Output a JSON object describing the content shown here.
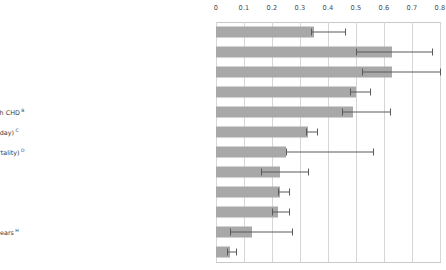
{
  "chart_data": {
    "type": "bar",
    "orientation": "horizontal",
    "title": "",
    "subtitle": "",
    "xlabel": "",
    "ylabel": "",
    "xlim": [
      0,
      0.8
    ],
    "grid": true,
    "legend": "none",
    "tick_labels": [
      "0",
      "0.1",
      "0.2",
      "0.3",
      "0.4",
      "0.5",
      "0.6",
      "0.7",
      "0.8"
    ],
    "tick_values": [
      0,
      0.1,
      0.2,
      0.3,
      0.4,
      0.5,
      0.6,
      0.7,
      0.8
    ],
    "categories": [
      "Social Relationships: Overall findings from this meta-analysis",
      "Social Relationships: High vs. low social support contrasted",
      "Social Relationships: Complex measures of social integration",
      "Smoking < 15 cigarettes daily",
      "Smoking Cessation: Cease vs. Continue smoking among patients with CHD",
      "Alcohol Consumption: Abstinence vs. Excessive drinking (> 6 drinks/day)",
      "Flu Vaccine: Pneumococcal vaccination in adults (for pneumonia mortality)",
      "Cardiac Rehabilitation (exercise) for patients with CHD",
      "Physical Activity (controlling for adiposity)",
      "BMI: Lean vs. obese",
      "Drug Treatment for Hypertension (vs. controls) in populations > 59 years",
      "Air Pollution: Low vs. high"
    ],
    "category_notes": [
      "",
      "",
      "",
      "A",
      "B",
      "C",
      "D",
      "E",
      "F",
      "G",
      "H",
      "I"
    ],
    "values": [
      0.35,
      0.63,
      0.63,
      0.5,
      0.49,
      0.33,
      0.25,
      0.23,
      0.23,
      0.22,
      0.13,
      0.05
    ],
    "ci_low": [
      0.34,
      0.5,
      0.52,
      0.48,
      0.45,
      0.32,
      0.25,
      0.16,
      0.22,
      0.2,
      0.05,
      0.04
    ],
    "ci_high": [
      0.46,
      0.77,
      0.8,
      0.55,
      0.62,
      0.36,
      0.56,
      0.33,
      0.26,
      0.26,
      0.27,
      0.07
    ],
    "bar_color": "#a8a8a8",
    "error_color": "#5a5a5a",
    "grid_color": "#d6d6d6"
  },
  "rows": [
    {
      "label": "Social Relationships: Overall findings from this meta-analysis",
      "note": "",
      "value": 0.35,
      "ci_low": 0.34,
      "ci_high": 0.46
    },
    {
      "label": "Social Relationships: High vs. low social support contrasted",
      "note": "",
      "value": 0.63,
      "ci_low": 0.5,
      "ci_high": 0.77
    },
    {
      "label": "Social Relationships: Complex measures of social integration",
      "note": "",
      "value": 0.63,
      "ci_low": 0.52,
      "ci_high": 0.8
    },
    {
      "label": "Smoking < 15 cigarettes daily",
      "note": "A",
      "value": 0.5,
      "ci_low": 0.48,
      "ci_high": 0.55
    },
    {
      "label": "Smoking Cessation: Cease vs. Continue smoking among patients with CHD",
      "note": "B",
      "value": 0.49,
      "ci_low": 0.45,
      "ci_high": 0.62
    },
    {
      "label": "Alcohol Consumption: Abstinence vs. Excessive drinking (> 6 drinks/day)",
      "note": "C",
      "value": 0.33,
      "ci_low": 0.32,
      "ci_high": 0.36
    },
    {
      "label": "Flu Vaccine: Pneumococcal vaccination in adults (for pneumonia mortality)",
      "note": "D",
      "value": 0.25,
      "ci_low": 0.25,
      "ci_high": 0.56
    },
    {
      "label": "Cardiac Rehabilitation (exercise) for patients with CHD",
      "note": "E",
      "value": 0.23,
      "ci_low": 0.16,
      "ci_high": 0.33
    },
    {
      "label": "Physical Activity (controlling for adiposity)",
      "note": "F",
      "value": 0.23,
      "ci_low": 0.22,
      "ci_high": 0.26
    },
    {
      "label": "BMI: Lean vs. obese",
      "note": "G",
      "value": 0.22,
      "ci_low": 0.2,
      "ci_high": 0.26
    },
    {
      "label": "Drug Treatment for Hypertension (vs. controls) in populations > 59 years",
      "note": "H",
      "value": 0.13,
      "ci_low": 0.05,
      "ci_high": 0.27
    },
    {
      "label": "Air Pollution: Low vs. high",
      "note": "I",
      "value": 0.05,
      "ci_low": 0.04,
      "ci_high": 0.07
    }
  ]
}
